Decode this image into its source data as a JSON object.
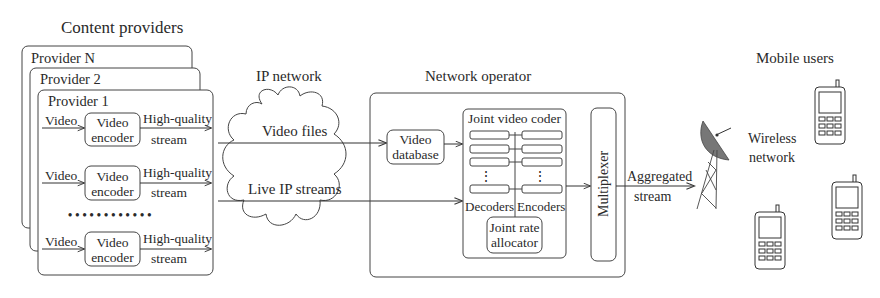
{
  "sections": {
    "content_providers": "Content providers",
    "ip_network": "IP network",
    "network_operator": "Network operator",
    "mobile_users": "Mobile users"
  },
  "providers": [
    {
      "label": "Provider N"
    },
    {
      "label": "Provider 2"
    },
    {
      "label": "Provider 1"
    }
  ],
  "encoder_rows": [
    {
      "input": "Video",
      "block_line1": "Video",
      "block_line2": "encoder",
      "output_line1": "High-quality",
      "output_line2": "stream"
    },
    {
      "input": "Video",
      "block_line1": "Video",
      "block_line2": "encoder",
      "output_line1": "High-quality",
      "output_line2": "stream"
    },
    {
      "input": "Video",
      "block_line1": "Video",
      "block_line2": "encoder",
      "output_line1": "High-quality",
      "output_line2": "stream"
    }
  ],
  "ellipsis": "• • • • • • • • • • • •",
  "ip_flows": {
    "video_files": "Video files",
    "live_streams": "Live IP streams"
  },
  "operator": {
    "video_database_line1": "Video",
    "video_database_line2": "database",
    "joint_video_coder": "Joint video coder",
    "decoders": "Decoders",
    "encoders": "Encoders",
    "vdots": "⋮",
    "rate_allocator_line1": "Joint rate",
    "rate_allocator_line2": "allocator",
    "multiplexer": "Multiplexer"
  },
  "output": {
    "aggregated_line1": "Aggregated",
    "aggregated_line2": "stream",
    "wireless_line1": "Wireless",
    "wireless_line2": "network"
  }
}
